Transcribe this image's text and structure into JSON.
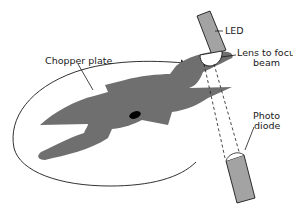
{
  "diagram": {
    "type": "optical chopper schematic",
    "labels": {
      "led": "LED",
      "lens_line1": "Lens to focus",
      "lens_line2": "beam",
      "chopper_plate": "Chopper plate",
      "photodiode_line1": "Photo",
      "photodiode_line2": "diode"
    },
    "components": [
      {
        "id": "led",
        "name": "LED",
        "shape": "tilted rectangle"
      },
      {
        "id": "lens",
        "name": "Lens to focus beam",
        "shape": "half disc"
      },
      {
        "id": "chopper-plate",
        "name": "Chopper plate",
        "shape": "four-bladed rotor"
      },
      {
        "id": "photodiode",
        "name": "Photo diode",
        "shape": "tilted rectangle"
      },
      {
        "id": "rotation-arrow",
        "name": "rotation direction",
        "shape": "elliptical arrow"
      },
      {
        "id": "light-beam",
        "name": "light beam",
        "shape": "dashed lines"
      }
    ],
    "colors": {
      "plate": "#6f6f6f",
      "device": "#a3a3a3",
      "outline": "#1a1a1a",
      "hub": "#000000"
    }
  }
}
